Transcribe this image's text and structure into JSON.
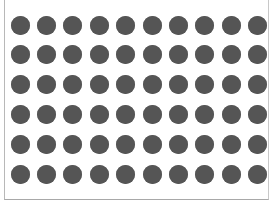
{
  "grid": {
    "rows": 6,
    "cols": 10,
    "dot_color": "#555555",
    "background": "#ffffff",
    "frame_color": "#b8b8b8",
    "dot_diameter": 19,
    "col_start": 20,
    "col_pitch": 26.4,
    "row_start": 25,
    "row_pitch": 29.8
  }
}
